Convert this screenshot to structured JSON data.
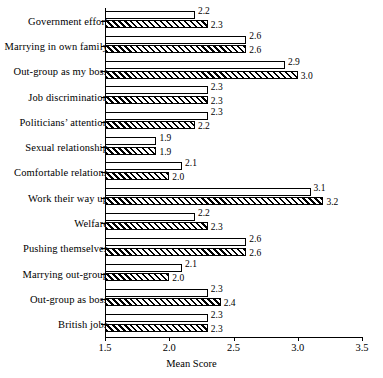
{
  "chart_data": {
    "type": "bar",
    "orientation": "horizontal",
    "title": "",
    "xlabel": "Mean Score",
    "ylabel": "",
    "xlim": [
      1.5,
      3.5
    ],
    "xticks": [
      "1.5",
      "2.0",
      "2.5",
      "3.0",
      "3.5"
    ],
    "xtick_values": [
      1.5,
      2.0,
      2.5,
      3.0,
      3.5
    ],
    "grid": false,
    "legend": null,
    "categories": [
      "Government effort",
      "Marrying in own family",
      "Out-group as my boss",
      "Job discrimination",
      "Politicians’ attention",
      "Sexual relationship",
      "Comfortable relations",
      "Work their way up",
      "Welfare",
      "Pushing themselves",
      "Marrying out-group",
      "Out-group as boss",
      "British jobs"
    ],
    "series": [
      {
        "name": "series-white",
        "style": "white",
        "values": [
          2.2,
          2.6,
          2.9,
          2.3,
          2.3,
          1.9,
          2.1,
          3.1,
          2.2,
          2.6,
          2.1,
          2.3,
          2.3
        ],
        "labels": [
          "2.2",
          "2.6",
          "2.9",
          "2.3",
          "2.3",
          "1.9",
          "2.1",
          "3.1",
          "2.2",
          "2.6",
          "2.1",
          "2.3",
          "2.3"
        ]
      },
      {
        "name": "series-hatched",
        "style": "hatched",
        "values": [
          2.3,
          2.6,
          3.0,
          2.3,
          2.2,
          1.9,
          2.0,
          3.2,
          2.3,
          2.6,
          2.0,
          2.4,
          2.3
        ],
        "labels": [
          "2.3",
          "2.6",
          "3.0",
          "2.3",
          "2.2",
          "1.9",
          "2.0",
          "3.2",
          "2.3",
          "2.6",
          "2.0",
          "2.4",
          "2.3"
        ]
      }
    ]
  }
}
